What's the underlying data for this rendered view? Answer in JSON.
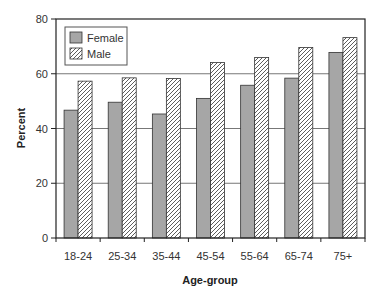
{
  "chart_data": {
    "type": "bar",
    "title": "",
    "xlabel": "Age-group",
    "ylabel": "Percent",
    "ylim": [
      0,
      80
    ],
    "yticks": [
      0,
      20,
      40,
      60,
      80
    ],
    "grid": true,
    "legend_position": "upper-left-inside",
    "categories": [
      "18-24",
      "25-34",
      "35-44",
      "45-54",
      "55-64",
      "65-74",
      "75+"
    ],
    "series": [
      {
        "name": "Female",
        "fill": "#a6a6a6",
        "pattern": "solid",
        "values": [
          46.7,
          49.6,
          45.3,
          51.0,
          55.8,
          58.4,
          67.8
        ]
      },
      {
        "name": "Male",
        "fill": "#ffffff",
        "pattern": "diagonal-hatch",
        "values": [
          57.3,
          58.5,
          58.3,
          64.1,
          65.9,
          69.6,
          73.2
        ]
      }
    ]
  },
  "legend": {
    "female_label": "Female",
    "male_label": "Male"
  },
  "axes": {
    "x_title": "Age-group",
    "y_title": "Percent"
  },
  "colors": {
    "female": "#a6a6a6",
    "male_hatch": "#333333",
    "grid": "#777777",
    "frame": "#222222"
  }
}
